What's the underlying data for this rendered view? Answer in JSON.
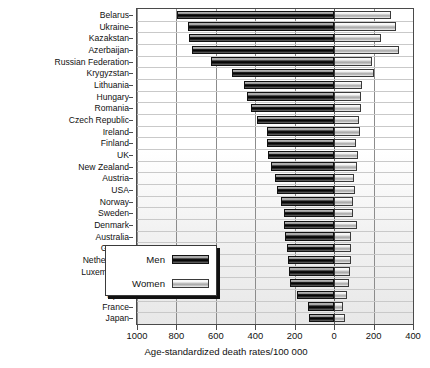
{
  "chart_data": {
    "type": "bar",
    "orientation": "horizontal",
    "layout": "back-to-back pyramid",
    "title": "",
    "xlabel": "Age-standardized death rates/100 000",
    "ylabel": "",
    "xlim": [
      -1000,
      400
    ],
    "xticks": [
      1000,
      800,
      600,
      400,
      200,
      0,
      200,
      400
    ],
    "xtick_positions": [
      -1000,
      -800,
      -600,
      -400,
      -200,
      0,
      200,
      400
    ],
    "grid": true,
    "legend_position": "bottom-left-inside",
    "categories": [
      "Belarus",
      "Ukraine",
      "Kazakstan",
      "Azerbaijan",
      "Russian Federation",
      "Krygyzstan",
      "Lithuania",
      "Hungary",
      "Romania",
      "Czech Republic",
      "Ireland",
      "Finland",
      "UK",
      "New Zealand",
      "Austria",
      "USA",
      "Norway",
      "Sweden",
      "Denmark",
      "Australia",
      "Greece",
      "Netherlands",
      "Luxembourg",
      "Italy",
      "Spain",
      "France",
      "Japan"
    ],
    "series": [
      {
        "name": "Men",
        "color": "#111111",
        "direction": "left",
        "values": [
          795,
          740,
          735,
          720,
          625,
          520,
          455,
          440,
          420,
          390,
          340,
          340,
          335,
          320,
          300,
          290,
          270,
          255,
          255,
          250,
          240,
          235,
          230,
          225,
          190,
          135,
          130
        ]
      },
      {
        "name": "Women",
        "color": "#d8d8d8",
        "direction": "right",
        "values": [
          290,
          315,
          240,
          330,
          190,
          205,
          140,
          135,
          135,
          125,
          130,
          110,
          120,
          115,
          100,
          105,
          95,
          95,
          115,
          85,
          85,
          85,
          80,
          75,
          65,
          45,
          55
        ]
      }
    ]
  },
  "legend": {
    "items": [
      {
        "label": "Men",
        "style": "men"
      },
      {
        "label": "Women",
        "style": "women"
      }
    ]
  },
  "axis": {
    "x_title": "Age-standardized death rates/100 000",
    "tick_labels": [
      "1000",
      "800",
      "600",
      "400",
      "200",
      "0",
      "200",
      "400"
    ]
  }
}
